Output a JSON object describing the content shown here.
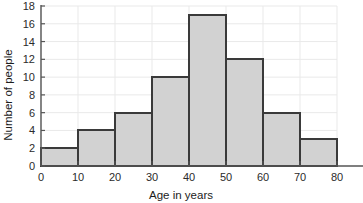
{
  "chart_data": {
    "type": "bar",
    "title": "",
    "subtitle": "",
    "xlabel": "Age in years",
    "ylabel": "Number of people",
    "categories": [
      "0-10",
      "10-20",
      "20-30",
      "30-40",
      "40-50",
      "50-60",
      "60-70",
      "70-80"
    ],
    "bin_edges": [
      0,
      10,
      20,
      30,
      40,
      50,
      60,
      70,
      80
    ],
    "values": [
      2,
      4,
      6,
      10,
      17,
      12,
      6,
      3
    ],
    "xlim": [
      0,
      80
    ],
    "ylim": [
      0,
      18
    ],
    "x_ticks": [
      "0",
      "10",
      "20",
      "30",
      "40",
      "50",
      "60",
      "70",
      "80"
    ],
    "x_tick_values": [
      0,
      10,
      20,
      30,
      40,
      50,
      60,
      70,
      80
    ],
    "y_ticks": [
      "0",
      "2",
      "4",
      "6",
      "8",
      "10",
      "12",
      "14",
      "16",
      "18"
    ],
    "y_tick_values": [
      0,
      2,
      4,
      6,
      8,
      10,
      12,
      14,
      16,
      18
    ],
    "grid": true,
    "legend": null,
    "legend_position": "none",
    "annotations": [],
    "colors": {
      "bar_fill": "#d2d2d2",
      "bar_edge": "#3a3a3a",
      "grid": "#e9e9e9",
      "axis": "#555555",
      "text": "#1c1c1c",
      "background": "#ffffff"
    }
  }
}
